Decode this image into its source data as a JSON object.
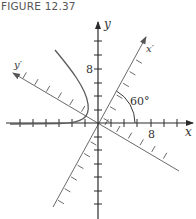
{
  "figure": {
    "title": "FIGURE 12.37",
    "axes": {
      "x_label": "x",
      "y_label": "y",
      "x_prime_label": "x′",
      "y_prime_label": "y′",
      "x_tick_label": "8",
      "y_tick_label": "8",
      "angle_label": "60°"
    },
    "colors": {
      "axis": "#3a3a3a",
      "rotated_axis": "#6a6a6a",
      "curve": "#5a5a5a",
      "title": "#555555"
    }
  }
}
